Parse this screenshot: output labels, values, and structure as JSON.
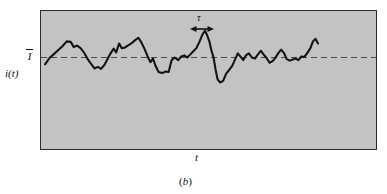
{
  "figure": {
    "caption": "(b)",
    "caption_letter": "b",
    "background_color": "#ffffff",
    "plot_fill_color": "#c3c3c3",
    "border_color": "#2b2b2b",
    "trace_color": "#141414",
    "mean_line_color": "#4a4a4a"
  },
  "labels": {
    "y_axis": "i(t)",
    "x_axis": "t",
    "mean_value": "I",
    "mean_value_description": "I-bar (time-averaged current)",
    "interval": "τ"
  },
  "annotations": {
    "tau_marker": {
      "label": "τ",
      "x_start": 191,
      "x_end": 213,
      "y": 29,
      "style": "double-headed-arrow"
    }
  },
  "chart_data": {
    "type": "line",
    "title": "",
    "xlabel": "t",
    "ylabel": "i(t)",
    "grid": false,
    "legend": null,
    "mean_line": {
      "label": "I",
      "value": 0,
      "style": "dashed"
    },
    "xlim": [
      0,
      100
    ],
    "ylim": [
      -1,
      1
    ],
    "series": [
      {
        "name": "i(t)",
        "points": [
          [
            1.2,
            -0.13
          ],
          [
            3.0,
            -0.01
          ],
          [
            4.6,
            0.06
          ],
          [
            6.4,
            0.14
          ],
          [
            8.2,
            0.22
          ],
          [
            9.8,
            0.31
          ],
          [
            11.4,
            0.3
          ],
          [
            12.6,
            0.2
          ],
          [
            13.9,
            0.23
          ],
          [
            15.3,
            0.18
          ],
          [
            16.6,
            0.1
          ],
          [
            18.0,
            -0.02
          ],
          [
            19.4,
            -0.12
          ],
          [
            20.8,
            -0.21
          ],
          [
            22.2,
            -0.18
          ],
          [
            23.4,
            -0.22
          ],
          [
            24.8,
            -0.14
          ],
          [
            26.0,
            -0.03
          ],
          [
            27.2,
            0.08
          ],
          [
            28.4,
            0.17
          ],
          [
            29.4,
            0.1
          ],
          [
            30.6,
            0.27
          ],
          [
            31.6,
            0.18
          ],
          [
            32.8,
            0.19
          ],
          [
            34.0,
            0.23
          ],
          [
            35.4,
            0.27
          ],
          [
            36.8,
            0.33
          ],
          [
            38.2,
            0.38
          ],
          [
            39.4,
            0.29
          ],
          [
            40.6,
            0.17
          ],
          [
            41.8,
            0.03
          ],
          [
            43.0,
            -0.09
          ],
          [
            44.0,
            -0.02
          ],
          [
            45.0,
            -0.16
          ],
          [
            46.2,
            -0.28
          ],
          [
            47.6,
            -0.3
          ],
          [
            49.0,
            -0.27
          ],
          [
            50.2,
            -0.28
          ],
          [
            51.4,
            -0.05
          ],
          [
            52.6,
            0.0
          ],
          [
            54.0,
            -0.05
          ],
          [
            55.2,
            0.02
          ],
          [
            56.4,
            0.04
          ],
          [
            57.6,
            0.0
          ],
          [
            58.8,
            0.06
          ],
          [
            60.0,
            0.12
          ],
          [
            61.2,
            0.18
          ],
          [
            62.4,
            0.3
          ],
          [
            63.6,
            0.44
          ],
          [
            64.6,
            0.52
          ],
          [
            65.6,
            0.41
          ],
          [
            66.4,
            0.3
          ],
          [
            67.2,
            0.13
          ],
          [
            68.0,
            0.0
          ],
          [
            68.8,
            -0.23
          ],
          [
            69.6,
            -0.42
          ],
          [
            70.6,
            -0.48
          ],
          [
            71.8,
            -0.45
          ],
          [
            73.0,
            -0.31
          ],
          [
            74.2,
            -0.24
          ],
          [
            75.4,
            -0.16
          ],
          [
            76.6,
            -0.03
          ],
          [
            77.6,
            0.08
          ],
          [
            78.6,
            0.02
          ],
          [
            79.8,
            -0.05
          ],
          [
            80.8,
            0.04
          ],
          [
            82.0,
            0.08
          ],
          [
            83.2,
            0.0
          ],
          [
            84.4,
            -0.02
          ],
          [
            85.6,
            0.06
          ],
          [
            86.8,
            0.13
          ],
          [
            87.8,
            0.06
          ],
          [
            89.0,
            -0.01
          ],
          [
            90.2,
            -0.1
          ],
          [
            91.4,
            -0.07
          ],
          [
            92.6,
            0.0
          ],
          [
            93.6,
            0.08
          ],
          [
            94.8,
            0.15
          ],
          [
            96.0,
            0.08
          ],
          [
            97.0,
            -0.03
          ],
          [
            98.2,
            -0.06
          ],
          [
            99.4,
            -0.04
          ],
          [
            100.6,
            -0.02
          ],
          [
            101.6,
            -0.05
          ],
          [
            102.8,
            0.02
          ],
          [
            104.0,
            0.01
          ],
          [
            105.2,
            0.09
          ],
          [
            106.4,
            0.18
          ],
          [
            107.4,
            0.31
          ],
          [
            108.4,
            0.36
          ],
          [
            109.4,
            0.27
          ]
        ]
      }
    ]
  }
}
